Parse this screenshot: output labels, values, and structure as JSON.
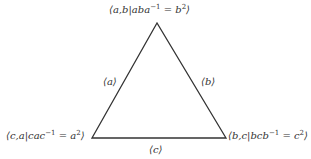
{
  "diagram": {
    "type": "triangle-graph-of-groups",
    "line_color": "#333333",
    "vertices": {
      "top": {
        "group": "a,b",
        "relation_lhs": "aba",
        "exp": "−1",
        "rhs": "b",
        "rhs_exp": "2",
        "x": 157,
        "y": 23
      },
      "left": {
        "group": "c,a",
        "relation_lhs": "cac",
        "exp": "−1",
        "rhs": "a",
        "rhs_exp": "2",
        "x": 92,
        "y": 138
      },
      "right": {
        "group": "b,c",
        "relation_lhs": "bcb",
        "exp": "−1",
        "rhs": "c",
        "rhs_exp": "2",
        "x": 226,
        "y": 138
      }
    },
    "edges": {
      "left": "⟨a⟩",
      "right": "⟨b⟩",
      "bottom": "⟨c⟩"
    }
  }
}
